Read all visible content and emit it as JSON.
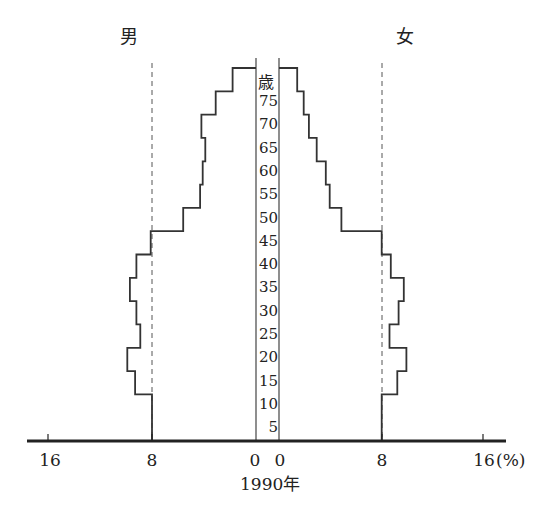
{
  "chart_data": {
    "type": "bar",
    "subtype": "population-pyramid",
    "title": "",
    "year_label": "1990年",
    "xlabel": "(%)",
    "ylabel": "歳",
    "left_label": "男",
    "right_label": "女",
    "x_ticks": [
      "16",
      "8",
      "0",
      "0",
      "8",
      "16"
    ],
    "xlim": [
      0,
      16
    ],
    "reference_line": 8,
    "categories": [
      "0-4",
      "5-9",
      "10-14",
      "15-19",
      "20-24",
      "25-29",
      "30-34",
      "35-39",
      "40-44",
      "45-49",
      "50-54",
      "55-59",
      "60-64",
      "65-69",
      "70-74",
      "75+"
    ],
    "age_tick_labels": [
      "5",
      "10",
      "15",
      "20",
      "25",
      "30",
      "35",
      "40",
      "45",
      "50",
      "55",
      "60",
      "65",
      "70",
      "75",
      "歳"
    ],
    "series": [
      {
        "name": "男",
        "values": [
          8.0,
          8.0,
          9.3,
          9.9,
          8.9,
          9.2,
          9.7,
          9.2,
          8.1,
          5.6,
          4.3,
          4.1,
          3.9,
          4.2,
          3.1,
          1.8
        ]
      },
      {
        "name": "女",
        "values": [
          7.9,
          7.9,
          9.1,
          9.8,
          8.5,
          9.2,
          9.6,
          8.6,
          7.9,
          4.8,
          3.9,
          3.6,
          2.9,
          2.3,
          1.9,
          1.4
        ]
      }
    ]
  },
  "labels": {
    "male": "男",
    "female": "女",
    "year": "1990年",
    "unit": "(%)",
    "age_unit": "歳",
    "ticks": {
      "l16": "16",
      "l8": "8",
      "l0": "0",
      "r0": "0",
      "r8": "8",
      "r16": "16"
    },
    "ages": [
      "75",
      "70",
      "65",
      "60",
      "55",
      "50",
      "45",
      "40",
      "35",
      "30",
      "25",
      "20",
      "15",
      "10",
      "5"
    ]
  }
}
